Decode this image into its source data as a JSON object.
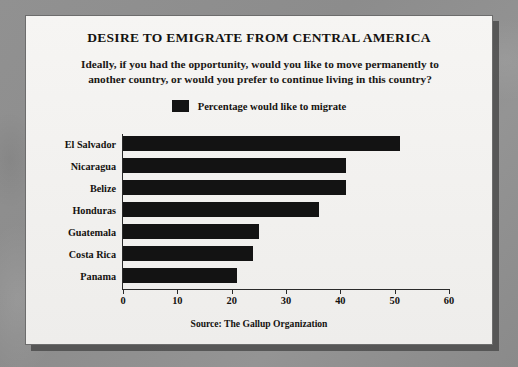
{
  "card": {
    "title": "DESIRE TO EMIGRATE FROM CENTRAL AMERICA",
    "subtitle": "Ideally, if you had the opportunity, would you like to move permanently to another country, or would you prefer to continue living in this country?",
    "source": "Source: The Gallup Organization"
  },
  "legend": {
    "label": "Percentage would like to migrate",
    "swatch_color": "#131313"
  },
  "chart_data": {
    "type": "bar",
    "orientation": "horizontal",
    "title": "DESIRE TO EMIGRATE FROM CENTRAL AMERICA",
    "subtitle": "Ideally, if you had the opportunity, would you like to move permanently to another country, or would you prefer to continue living in this country?",
    "categories": [
      "El Salvador",
      "Nicaragua",
      "Belize",
      "Honduras",
      "Guatemala",
      "Costa Rica",
      "Panama"
    ],
    "values": [
      51,
      41,
      41,
      36,
      25,
      24,
      21
    ],
    "series": [
      {
        "name": "Percentage would like to migrate",
        "values": [
          51,
          41,
          41,
          36,
          25,
          24,
          21
        ],
        "color": "#131313"
      }
    ],
    "xlabel": "",
    "ylabel": "",
    "xlim": [
      0,
      60
    ],
    "xticks": [
      0,
      10,
      20,
      30,
      40,
      50,
      60
    ],
    "xtick_labels": [
      "0",
      "10",
      "20",
      "30",
      "40",
      "50",
      "60"
    ],
    "grid": false,
    "legend_position": "top-center",
    "source": "Source: The Gallup Organization"
  }
}
